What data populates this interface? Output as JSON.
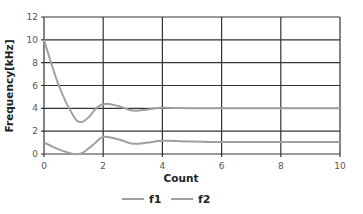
{
  "chart_data": {
    "type": "line",
    "title": "",
    "xlabel": "Count",
    "ylabel": "Frequency[kHz]",
    "xlim": [
      0,
      10
    ],
    "ylim": [
      0,
      12
    ],
    "xticks": [
      0,
      2,
      4,
      6,
      8,
      10
    ],
    "yticks": [
      0,
      2,
      4,
      6,
      8,
      10,
      12
    ],
    "grid": true,
    "legend_position": "bottom",
    "series": [
      {
        "name": "f1",
        "color": "#a0a0a0",
        "x": [
          0,
          0.5,
          1.0,
          1.25,
          1.5,
          1.8,
          2.1,
          2.5,
          3.0,
          3.5,
          4.0,
          5,
          6,
          7,
          8,
          9,
          10
        ],
        "values": [
          10.0,
          6.0,
          3.3,
          2.8,
          3.2,
          4.1,
          4.4,
          4.2,
          3.8,
          3.9,
          4.05,
          4.0,
          4.0,
          4.0,
          4.0,
          4.0,
          4.0
        ]
      },
      {
        "name": "f2",
        "color": "#a0a0a0",
        "x": [
          0,
          0.5,
          1.0,
          1.3,
          1.7,
          2.0,
          2.5,
          3.0,
          3.5,
          4.0,
          5,
          6,
          7,
          8,
          9,
          10
        ],
        "values": [
          1.0,
          0.4,
          0.0,
          0.1,
          0.9,
          1.5,
          1.3,
          0.9,
          1.0,
          1.15,
          1.1,
          1.05,
          1.05,
          1.05,
          1.05,
          1.05
        ]
      }
    ]
  },
  "plot": {
    "left": 44,
    "right": 340,
    "top": 17,
    "bottom": 154,
    "grid_color": "#333333"
  },
  "legend": {
    "items": [
      {
        "label": "f1",
        "color": "#a0a0a0"
      },
      {
        "label": "f2",
        "color": "#a0a0a0"
      }
    ]
  }
}
